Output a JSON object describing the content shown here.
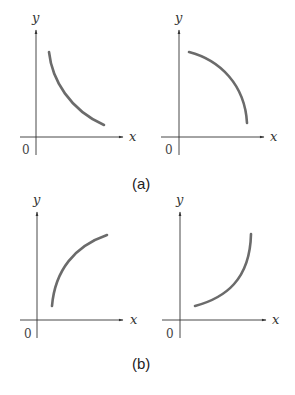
{
  "figure": {
    "panels": [
      {
        "id": "a",
        "caption": "(a)"
      },
      {
        "id": "b",
        "caption": "(b)"
      }
    ],
    "graphs": [
      {
        "name": "a-left",
        "x_label": "x",
        "y_label": "y",
        "origin_label": "0",
        "shape": "decreasing, concave up"
      },
      {
        "name": "a-right",
        "x_label": "x",
        "y_label": "y",
        "origin_label": "0",
        "shape": "decreasing, concave down"
      },
      {
        "name": "b-left",
        "x_label": "x",
        "y_label": "y",
        "origin_label": "0",
        "shape": "increasing, concave down"
      },
      {
        "name": "b-right",
        "x_label": "x",
        "y_label": "y",
        "origin_label": "0",
        "shape": "increasing, concave up"
      }
    ],
    "colors": {
      "axis": "#333333",
      "curve": "#6b6b6b"
    }
  }
}
